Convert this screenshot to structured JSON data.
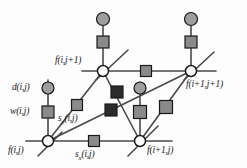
{
  "figure": {
    "colors": {
      "line": "#4a4a4a",
      "node_fill": "#ffffff",
      "node_stroke": "#1a1a1a",
      "square_gray": "#8a8a8a",
      "square_dark": "#2b2b2b",
      "circle_gray": "#9e9e9e",
      "text": "#1a1a1a",
      "background": "#fdfdfd"
    },
    "nodes": [
      {
        "id": "n-bottom-left",
        "label": "f(i,j)",
        "x": 48,
        "y": 141,
        "shape": "circle-open"
      },
      {
        "id": "n-bottom-right",
        "label": "f(i+1,j)",
        "x": 140,
        "y": 141,
        "shape": "circle-open"
      },
      {
        "id": "n-top-left",
        "label": "f(i,j+1)",
        "x": 103,
        "y": 71,
        "shape": "circle-open"
      },
      {
        "id": "n-top-right",
        "label": "f(i+1,j+1)",
        "x": 191,
        "y": 71,
        "shape": "circle-open"
      }
    ],
    "edge_markers": [
      {
        "id": "m-sx",
        "label": "s",
        "sublabel": "x",
        "args": "(i,j)",
        "x": 94,
        "y": 141,
        "tone": "gray"
      },
      {
        "id": "m-sy",
        "label": "s",
        "sublabel": "y",
        "args": "(i,j)",
        "x": 77,
        "y": 105,
        "tone": "gray"
      },
      {
        "id": "m-w",
        "label": "w",
        "sublabel": "",
        "args": "(i,j)",
        "x": 48,
        "y": 112,
        "tone": "gray"
      },
      {
        "id": "m-top-edge",
        "label": "",
        "sublabel": "",
        "args": "",
        "x": 146,
        "y": 71,
        "tone": "gray"
      },
      {
        "id": "m-top-left-stem",
        "label": "",
        "sublabel": "",
        "args": "",
        "x": 103,
        "y": 42,
        "tone": "gray"
      },
      {
        "id": "m-top-right-stem",
        "label": "",
        "sublabel": "",
        "args": "",
        "x": 191,
        "y": 42,
        "tone": "gray"
      },
      {
        "id": "m-right-stem",
        "label": "",
        "sublabel": "",
        "args": "",
        "x": 140,
        "y": 112,
        "tone": "gray"
      },
      {
        "id": "m-diag-right",
        "label": "",
        "sublabel": "",
        "args": "",
        "x": 166,
        "y": 107,
        "tone": "gray"
      },
      {
        "id": "m-center-upper",
        "label": "",
        "sublabel": "",
        "args": "",
        "x": 117,
        "y": 92,
        "tone": "dark"
      },
      {
        "id": "m-center-lower",
        "label": "",
        "sublabel": "",
        "args": "",
        "x": 111,
        "y": 110,
        "tone": "dark"
      }
    ],
    "data_markers": [
      {
        "id": "d-left",
        "label": "d",
        "args": "(i,j)",
        "x": 48,
        "y": 88,
        "tone": "gray"
      },
      {
        "id": "d-top-left",
        "label": "",
        "args": "",
        "x": 103,
        "y": 19,
        "tone": "gray"
      },
      {
        "id": "d-top-right",
        "label": "",
        "args": "",
        "x": 191,
        "y": 19,
        "tone": "gray"
      },
      {
        "id": "d-center",
        "label": "",
        "args": "",
        "x": 140,
        "y": 88,
        "tone": "gray"
      }
    ],
    "labels": {
      "f_ij": "f(i,j)",
      "f_i1j": "f(i+1,j)",
      "f_ij1": "f(i,j+1)",
      "f_i1j1": "f(i+1,j+1)",
      "d_ij_name": "d",
      "d_ij_args": "(i,j)",
      "w_ij_name": "w",
      "w_ij_args": "(i,j)",
      "sx_name": "s",
      "sx_sub": "x",
      "sx_args": "(i,j)",
      "sy_name": "s",
      "sy_sub": "y",
      "sy_args": "(i,j)"
    }
  }
}
